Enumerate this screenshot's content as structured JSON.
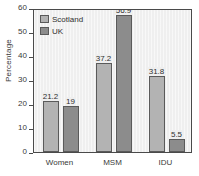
{
  "chart_data": {
    "type": "bar",
    "title": "",
    "xlabel": "",
    "ylabel": "Percentage",
    "ylim": [
      0,
      60
    ],
    "yticks": [
      0,
      10,
      20,
      30,
      40,
      50,
      60
    ],
    "grid": false,
    "legend_position": "top-left-inside",
    "categories": [
      "Women",
      "MSM",
      "IDU"
    ],
    "series": [
      {
        "name": "Scotland",
        "color": "#b3b3b3",
        "values": [
          21.2,
          37.2,
          31.8
        ],
        "labels": [
          "21.2",
          "37.2",
          "31.8"
        ]
      },
      {
        "name": "UK",
        "color": "#8c8c8c",
        "values": [
          19,
          56.9,
          5.5
        ],
        "labels": [
          "19",
          "56.9",
          "5.5"
        ]
      }
    ]
  },
  "axis": {
    "y_tick_labels": [
      "0",
      "10",
      "20",
      "30",
      "40",
      "50",
      "60"
    ],
    "y_title": "Percentage"
  },
  "legend": {
    "items": [
      {
        "label": "Scotland",
        "swatch": "scotland-swatch"
      },
      {
        "label": "UK",
        "swatch": "uk-swatch"
      }
    ]
  },
  "colors": {
    "scotland": "#b3b3b3",
    "uk": "#8c8c8c",
    "plot_background": "#efefef",
    "frame": "#4a4a4a",
    "text": "#3a3a3a"
  }
}
